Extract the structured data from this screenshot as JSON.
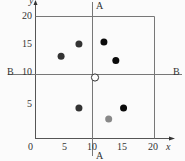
{
  "diagram": {
    "axes": {
      "x_label": "x",
      "y_label": "y",
      "origin_label": "0",
      "x_ticks": [
        "5",
        "10",
        "15",
        "20"
      ],
      "y_ticks": [
        "5",
        "10",
        "15",
        "20"
      ],
      "range": [
        0,
        20
      ]
    },
    "lines": {
      "vertical_label_top": "A",
      "vertical_label_bottom": "A",
      "horizontal_label_left": "B",
      "horizontal_label_right": "B",
      "vertical_at_x": 10,
      "horizontal_at_y": 10
    },
    "points": [
      {
        "x": 4.3,
        "y": 13.5,
        "color": "#333333",
        "style": "filled"
      },
      {
        "x": 7.3,
        "y": 15.5,
        "color": "#333333",
        "style": "filled"
      },
      {
        "x": 11.5,
        "y": 15.8,
        "color": "#0a0a0a",
        "style": "filled"
      },
      {
        "x": 13.5,
        "y": 12.8,
        "color": "#0a0a0a",
        "style": "filled"
      },
      {
        "x": 10.0,
        "y": 10.0,
        "color": "#ffffff",
        "style": "open"
      },
      {
        "x": 7.3,
        "y": 5.0,
        "color": "#333333",
        "style": "filled"
      },
      {
        "x": 14.8,
        "y": 5.0,
        "color": "#0a0a0a",
        "style": "filled"
      },
      {
        "x": 12.3,
        "y": 3.2,
        "color": "#888888",
        "style": "filled"
      }
    ]
  }
}
